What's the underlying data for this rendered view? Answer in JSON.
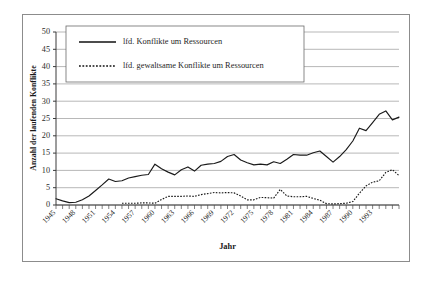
{
  "chart_data": {
    "type": "line",
    "title": "",
    "xlabel": "Jahr",
    "ylabel": "Anzahl der laufenden Konflikte",
    "xlim": [
      1945,
      1997
    ],
    "ylim": [
      0,
      50
    ],
    "ytick_step": 5,
    "grid": true,
    "legend_position": "top-center",
    "xtick_labels": [
      "1945",
      "1948",
      "1951",
      "1954",
      "1957",
      "1960",
      "1963",
      "1966",
      "1969",
      "1972",
      "1975",
      "1978",
      "1981",
      "1984",
      "1987",
      "1990",
      "1993"
    ],
    "ytick_labels": [
      "0",
      "5",
      "10",
      "15",
      "20",
      "25",
      "30",
      "35",
      "40",
      "45",
      "50"
    ],
    "x": [
      1945,
      1946,
      1947,
      1948,
      1949,
      1950,
      1951,
      1952,
      1953,
      1954,
      1955,
      1956,
      1957,
      1958,
      1959,
      1960,
      1961,
      1962,
      1963,
      1964,
      1965,
      1966,
      1967,
      1968,
      1969,
      1970,
      1971,
      1972,
      1973,
      1974,
      1975,
      1976,
      1977,
      1978,
      1979,
      1980,
      1981,
      1982,
      1983,
      1984,
      1985,
      1986,
      1987,
      1988,
      1989,
      1990,
      1991,
      1992,
      1993,
      1994,
      1995,
      1996,
      1997
    ],
    "series": [
      {
        "name": "lfd. Konflikte um Ressourcen",
        "style": "solid",
        "values": [
          1.8,
          1.2,
          0.7,
          0.8,
          1.5,
          2.6,
          4.2,
          5.8,
          7.5,
          6.8,
          7.0,
          7.8,
          8.2,
          8.6,
          8.8,
          11.8,
          10.5,
          9.5,
          8.7,
          10.2,
          11.0,
          9.8,
          11.5,
          11.8,
          12.0,
          12.6,
          14.0,
          14.6,
          13.0,
          12.2,
          11.6,
          11.8,
          11.6,
          12.5,
          12.0,
          13.2,
          14.6,
          14.4,
          14.4,
          15.1,
          15.6,
          14.0,
          12.4,
          14.0,
          16.0,
          18.5,
          22.2,
          21.5,
          23.8,
          26.2,
          27.2,
          24.6,
          25.4
        ]
      },
      {
        "name": "lfd. gewaltsame Konflikte um Ressourcen",
        "style": "dotted",
        "values": [
          null,
          null,
          null,
          null,
          null,
          null,
          null,
          null,
          null,
          null,
          0.5,
          0.5,
          0.5,
          0.6,
          0.6,
          0.5,
          1.6,
          2.5,
          2.5,
          2.5,
          2.6,
          2.5,
          3.0,
          3.3,
          3.6,
          3.5,
          3.6,
          3.5,
          2.6,
          1.5,
          1.5,
          2.2,
          2.1,
          2.0,
          4.5,
          2.6,
          2.4,
          2.4,
          2.5,
          1.9,
          1.4,
          0.4,
          0.3,
          0.4,
          0.5,
          1.0,
          3.4,
          5.5,
          6.6,
          7.0,
          9.4,
          10.2,
          8.5
        ]
      }
    ]
  },
  "legend": {
    "entries": [
      {
        "label": "lfd. Konflikte um Ressourcen",
        "style": "solid"
      },
      {
        "label": "lfd. gewaltsame Konflikte um Ressourcen",
        "style": "dotted"
      }
    ]
  },
  "axes": {
    "x_title": "Jahr",
    "y_title": "Anzahl der laufenden Konflikte"
  },
  "colors": {
    "line": "#1a1a1a",
    "grid": "#9a9a9a",
    "frame": "#8c8c8c",
    "background": "#ffffff"
  }
}
